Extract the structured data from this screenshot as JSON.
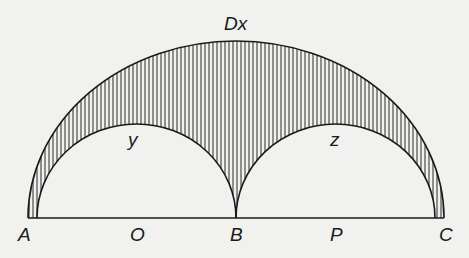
{
  "diagram": {
    "colors": {
      "background": "#f1f1ef",
      "stroke": "#1a1a1a",
      "hatch": "#2a2a2a"
    },
    "labels": {
      "top": "Dx",
      "left_inner": "y",
      "right_inner": "z",
      "A": "A",
      "O": "O",
      "B": "B",
      "P": "P",
      "C": "C"
    }
  }
}
